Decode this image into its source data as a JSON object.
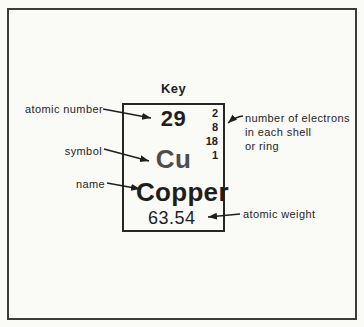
{
  "figure": {
    "title": "Key",
    "card": {
      "atomic_number": "29",
      "symbol": "Cu",
      "name": "Copper",
      "atomic_weight": "63.54",
      "shells": [
        "2",
        "8",
        "18",
        "1"
      ]
    },
    "callouts": {
      "atomic_number": "atomic number",
      "symbol": "symbol",
      "name": "name",
      "electrons": [
        "number of electrons",
        "in each shell",
        "or ring"
      ],
      "atomic_weight": "atomic weight"
    },
    "colors": {
      "background": "#fafaf7",
      "ink": "#1e1e1e",
      "symbol_gray": "#4d4d4d",
      "frame": "#3c3c3c"
    }
  }
}
